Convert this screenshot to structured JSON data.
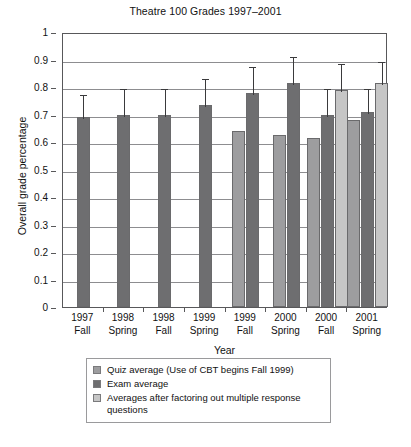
{
  "chart_data": {
    "type": "bar",
    "title": "Theatre 100 Grades 1997–2001",
    "xlabel": "Year",
    "ylabel": "Overall grade percentage",
    "ylim": [
      0,
      1
    ],
    "ytick_labels": [
      "1",
      "0.9",
      "0.8",
      "0.7",
      "0.6",
      "0.5",
      "0.4",
      "0.3",
      "0.2",
      "0.1",
      "0"
    ],
    "ytick_values": [
      1,
      0.9,
      0.8,
      0.7,
      0.6,
      0.5,
      0.4,
      0.3,
      0.2,
      0.1,
      0
    ],
    "grid": true,
    "legend_position": "below-axes",
    "categories": [
      "1997 Fall",
      "1998 Spring",
      "1998 Fall",
      "1999 Spring",
      "1999 Fall",
      "2000 Spring",
      "2000 Fall",
      "2001 Spring"
    ],
    "category_lines": [
      [
        "1997",
        "Fall"
      ],
      [
        "1998",
        "Spring"
      ],
      [
        "1998",
        "Fall"
      ],
      [
        "1999",
        "Spring"
      ],
      [
        "1999",
        "Fall"
      ],
      [
        "2000",
        "Spring"
      ],
      [
        "2000",
        "Fall"
      ],
      [
        "2001",
        "Spring"
      ]
    ],
    "series": [
      {
        "name": "Quiz average (Use of CBT begins Fall 1999)",
        "color": "#9d9d9f",
        "values": [
          null,
          null,
          null,
          null,
          0.64,
          0.625,
          0.615,
          0.68
        ],
        "errors_upper": [
          null,
          null,
          null,
          null,
          null,
          null,
          null,
          null
        ]
      },
      {
        "name": "Exam average",
        "color": "#6e6e70",
        "values": [
          0.69,
          0.7,
          0.7,
          0.735,
          0.78,
          0.815,
          0.7,
          0.71
        ],
        "errors_upper": [
          0.78,
          0.8,
          0.8,
          0.835,
          0.88,
          0.915,
          0.8,
          0.8
        ]
      },
      {
        "name": "Averages after factoring out multiple response questions",
        "color": "#c6c6c6",
        "values": [
          null,
          null,
          null,
          null,
          null,
          null,
          0.79,
          0.815
        ],
        "errors_upper": [
          null,
          null,
          null,
          null,
          null,
          null,
          0.89,
          0.9
        ]
      }
    ]
  },
  "legend": {
    "items": [
      {
        "label": "Quiz average (Use of CBT begins Fall 1999)",
        "color": "#9d9d9f"
      },
      {
        "label": "Exam average",
        "color": "#6e6e70"
      },
      {
        "label": "Averages after factoring out multiple response questions",
        "color": "#c6c6c6"
      }
    ]
  }
}
